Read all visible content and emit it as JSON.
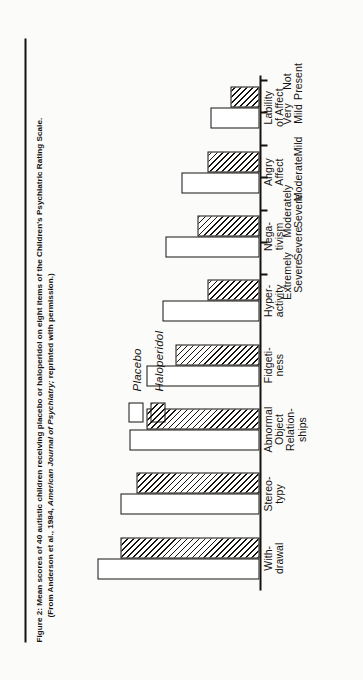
{
  "figure": {
    "caption_label": "Figure 2:",
    "caption_line1_a": "Mean scores of 40 autistic children receiving placebo or haloperidol on eight items of the Children's Psychiatric Rating Scale.",
    "caption_line2_a": "(From Anderson et al., 1984, ",
    "caption_line2_italic": "American Journal of Psychiatry;",
    "caption_line2_b": " reprinted with permission.)"
  },
  "legend": {
    "position": "top-left-inside",
    "items": [
      {
        "label": "Placebo",
        "swatch": "white-open-box"
      },
      {
        "label": "Haloperidol",
        "swatch": "diagonal-hatched-box"
      }
    ]
  },
  "chart_data": {
    "type": "bar",
    "title": "",
    "xlabel": "",
    "ylabel": "",
    "orientation": "vertical",
    "grid": false,
    "ylim": [
      0,
      6
    ],
    "ytick_values": [
      0,
      1,
      2,
      3,
      4,
      5,
      6
    ],
    "ytick_labels": [
      "Not\nPresent",
      "Very\nMild",
      "Mild",
      "Moderate",
      "Moderately\nSevere",
      "Severe",
      "Extremely\nSevere"
    ],
    "categories": [
      "With-\ndrawal",
      "Stereo-\ntypy",
      "Abnormal\nObject\nRelation-\nships",
      "Fidgeti-\nness",
      "Hyper-\nactivity",
      "Nega-\ntivism",
      "Angry\nAffect",
      "Lability\nof Affect"
    ],
    "series": [
      {
        "name": "Placebo",
        "values": [
          5.0,
          4.3,
          4.0,
          3.5,
          3.0,
          2.9,
          2.4,
          1.5
        ]
      },
      {
        "name": "Haloperidol",
        "values": [
          4.3,
          3.8,
          3.5,
          2.6,
          1.6,
          1.9,
          1.6,
          0.9
        ]
      }
    ]
  }
}
